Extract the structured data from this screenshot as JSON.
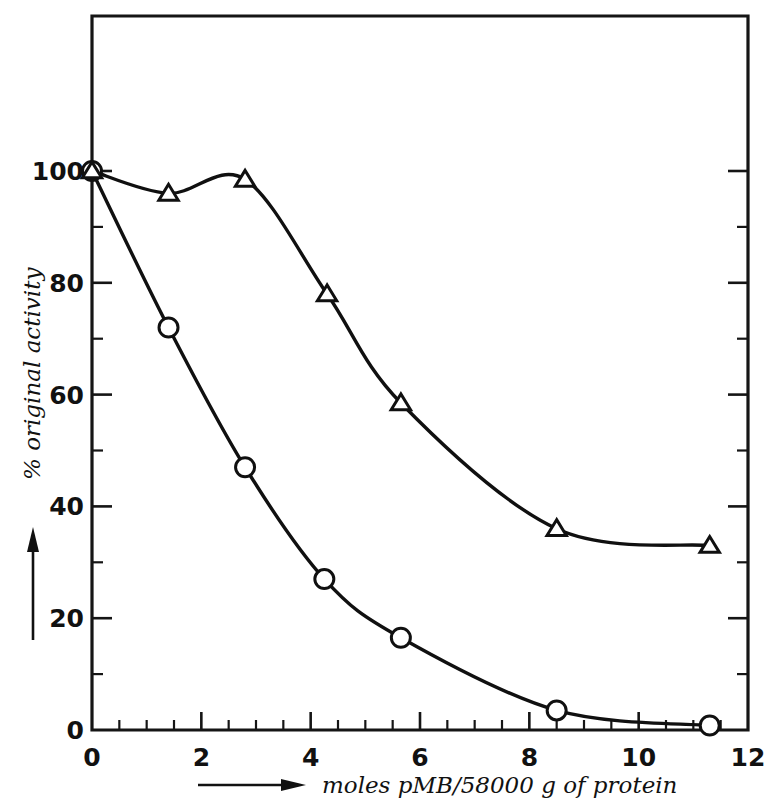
{
  "chart_data": {
    "type": "scatter",
    "title": "",
    "xlabel": "moles pMB/58000 g of protein",
    "ylabel": "% original activity",
    "xlim": [
      0,
      12
    ],
    "ylim": [
      0,
      105
    ],
    "x_ticks_major": [
      0,
      2,
      4,
      6,
      8,
      10,
      12
    ],
    "x_tick_labels": [
      "0",
      "2",
      "4",
      "6",
      "8",
      "10",
      "12"
    ],
    "x_tick_minor_step": 0.5,
    "y_ticks_major": [
      0,
      20,
      40,
      60,
      80,
      100
    ],
    "y_tick_labels": [
      "0",
      "20",
      "40",
      "60",
      "80",
      "100"
    ],
    "y_tick_minor_step": 10,
    "grid": false,
    "legend_position": "none",
    "frame": "box",
    "series": [
      {
        "name": "circle-series",
        "marker": "circle",
        "line_style": "solid",
        "color": "#101010",
        "x": [
          0,
          1.4,
          2.8,
          4.25,
          5.65,
          8.5,
          11.3
        ],
        "y": [
          100,
          72,
          47,
          27,
          16.5,
          3.5,
          0.8
        ]
      },
      {
        "name": "triangle-series",
        "marker": "triangle",
        "line_style": "solid",
        "color": "#101010",
        "x": [
          0,
          1.4,
          2.8,
          4.3,
          5.65,
          8.5,
          11.3
        ],
        "y": [
          100,
          96,
          98.5,
          78,
          58.5,
          36,
          33
        ]
      }
    ]
  },
  "axes": {
    "x_axis_label": "moles pMB/58000 g of protein",
    "y_axis_label": "% original activity",
    "x_labels": [
      "0",
      "2",
      "4",
      "6",
      "8",
      "10",
      "12"
    ],
    "y_labels": [
      "0",
      "20",
      "40",
      "60",
      "80",
      "100"
    ]
  }
}
